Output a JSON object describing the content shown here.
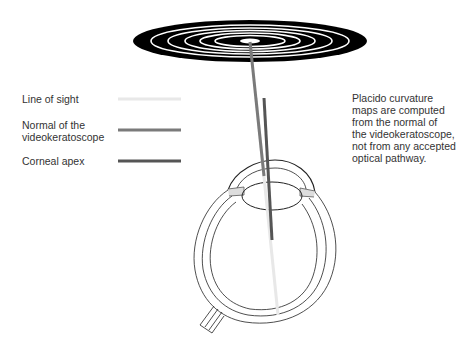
{
  "legend": {
    "items": [
      {
        "label": "Line of sight",
        "color": "#e8e8e8"
      },
      {
        "label": "Normal of the videokeratoscope",
        "label_line1": "Normal of the",
        "label_line2": "videokeratoscope",
        "color": "#7a7a7a"
      },
      {
        "label": "Corneal apex",
        "color": "#555555"
      }
    ]
  },
  "annotation": {
    "lines": [
      "Placido curvature",
      "maps are computed",
      "from the normal of",
      "the videokeratoscope,",
      "not from any accepted",
      "optical pathway."
    ]
  },
  "diagram": {
    "placido_rings": 6,
    "disc_color": "#000000",
    "ring_color": "#ffffff"
  }
}
